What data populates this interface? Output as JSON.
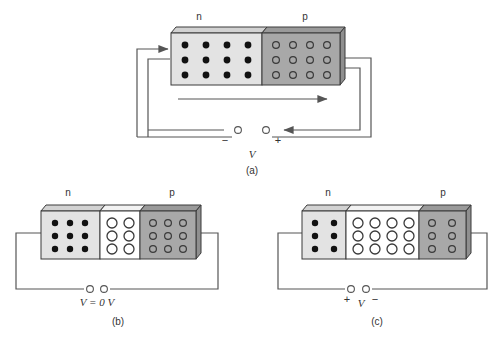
{
  "figure": {
    "title_alt": "pn junction diode under three bias conditions",
    "colors": {
      "n_region_fill": "#e3e3e3",
      "p_region_fill": "#a8a8a8",
      "depletion_fill": "#ffffff",
      "top_face_fill": "#d2d2d2",
      "top_face_p_fill": "#9a9a9a",
      "side_face_fill": "#8f8f8f",
      "outline": "#3a3a3a",
      "wire": "#555555",
      "text": "#333333",
      "carrier_electron": "#111111",
      "carrier_hole_outline": "#444444"
    }
  },
  "panels": [
    {
      "id": "a",
      "caption": "(a)",
      "region_labels": {
        "n": "n",
        "p": "p"
      },
      "voltage_label": "V",
      "polarity_left": "−",
      "polarity_right": "+",
      "has_depletion_region": false,
      "n_dot_rows": 3,
      "n_dot_cols": 4,
      "p_circle_rows": 3,
      "p_circle_cols": 4,
      "depletion_circle_rows": 0,
      "depletion_circle_cols": 0,
      "current_arrows": [
        "into-n-left",
        "out-of-p-right",
        "return-left"
      ]
    },
    {
      "id": "b",
      "caption": "(b)",
      "region_labels": {
        "n": "n",
        "p": "p"
      },
      "voltage_label": "V = 0 V",
      "voltage_label_italic": "V",
      "voltage_label_rest": " = 0 V",
      "polarity_left": "",
      "polarity_right": "",
      "has_depletion_region": true,
      "n_dot_rows": 3,
      "n_dot_cols": 3,
      "p_circle_rows": 3,
      "p_circle_cols": 3,
      "depletion_circle_rows": 3,
      "depletion_circle_cols": 2,
      "current_arrows": []
    },
    {
      "id": "c",
      "caption": "(c)",
      "region_labels": {
        "n": "n",
        "p": "p"
      },
      "voltage_label": "V",
      "polarity_left": "+",
      "polarity_right": "−",
      "has_depletion_region": true,
      "n_dot_rows": 3,
      "n_dot_cols": 2,
      "p_circle_rows": 3,
      "p_circle_cols": 2,
      "depletion_circle_rows": 3,
      "depletion_circle_cols": 4,
      "current_arrows": []
    }
  ]
}
